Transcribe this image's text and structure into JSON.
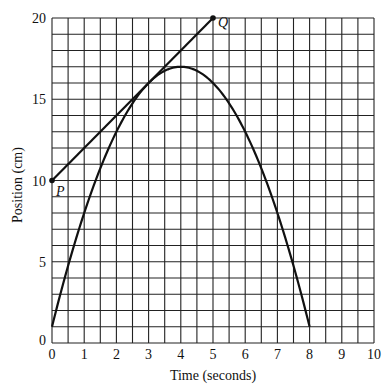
{
  "chart_data": {
    "type": "line",
    "title": "",
    "xlabel": "Time (seconds)",
    "ylabel": "Position (cm)",
    "xlim": [
      0,
      10
    ],
    "ylim": [
      0,
      20
    ],
    "grid": true,
    "x_ticks": [
      "0",
      "1",
      "2",
      "3",
      "4",
      "5",
      "6",
      "7",
      "8",
      "9",
      "10"
    ],
    "y_ticks": [
      "0",
      "5",
      "10",
      "15",
      "20"
    ],
    "x_grid_step": 0.5,
    "y_grid_step": 1,
    "series": [
      {
        "name": "position curve",
        "description": "parabola y = 17 - (x - 4)^2",
        "x": [
          0,
          0.5,
          1,
          1.5,
          2,
          2.5,
          3,
          3.5,
          4,
          4.5,
          5,
          5.5,
          6,
          6.5,
          7,
          7.5,
          8
        ],
        "y": [
          1,
          4.75,
          8,
          10.75,
          13,
          14.75,
          16,
          16.75,
          17,
          16.75,
          16,
          14.75,
          13,
          10.75,
          8,
          4.75,
          1
        ]
      },
      {
        "name": "tangent line PQ",
        "x": [
          0,
          5
        ],
        "y": [
          10,
          20
        ]
      }
    ],
    "annotations": [
      {
        "label": "P",
        "x": 0,
        "y": 10
      },
      {
        "label": "Q",
        "x": 5,
        "y": 20
      }
    ]
  }
}
